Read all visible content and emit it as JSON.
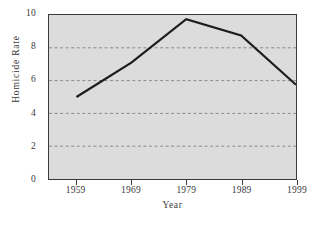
{
  "chart_data": {
    "type": "line",
    "title": "",
    "xlabel": "Year",
    "ylabel": "Homicide Rate",
    "x": [
      1959,
      1969,
      1979,
      1989,
      1999
    ],
    "categories": [
      "1959",
      "1969",
      "1979",
      "1989",
      "1999"
    ],
    "values": [
      5.0,
      7.1,
      9.75,
      8.75,
      5.75
    ],
    "series": [
      {
        "name": "Homicide Rate",
        "values": [
          5.0,
          7.1,
          9.75,
          8.75,
          5.75
        ]
      }
    ],
    "xlim": [
      1954,
      1999
    ],
    "ylim": [
      0,
      10
    ],
    "y_ticks": [
      0,
      2,
      4,
      6,
      8,
      10
    ],
    "y_tick_labels": [
      "0",
      "2",
      "4",
      "6",
      "8",
      "10"
    ],
    "x_ticks": [
      1959,
      1969,
      1979,
      1989,
      1999
    ],
    "x_tick_labels": [
      "1959",
      "1969",
      "1979",
      "1989",
      "1999"
    ],
    "gridlines": {
      "horizontal": [
        2,
        4,
        6,
        8
      ],
      "vertical": [],
      "style": "dashed"
    },
    "legend": null,
    "legend_position": "none",
    "annotations": [],
    "colors": {
      "plot_background": "#dcdcdc",
      "figure_background": "#ffffff",
      "line": "#1c1c1c",
      "axis": "#3a3a3a",
      "grid": "#8a8a8a",
      "text": "#3a3a3a"
    },
    "line_width": 2.2
  },
  "axes": {
    "y_title": "Homicide Rate",
    "x_title": "Year"
  }
}
